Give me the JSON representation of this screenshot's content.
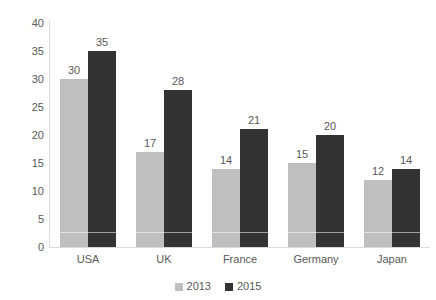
{
  "chart_data": {
    "type": "bar",
    "title": "",
    "subtitle": "",
    "xlabel": "",
    "ylabel": "",
    "categories": [
      "USA",
      "UK",
      "France",
      "Germany",
      "Japan"
    ],
    "series": [
      {
        "name": "2013",
        "color": "#bfbfbf",
        "values": [
          30,
          17,
          14,
          15,
          12
        ]
      },
      {
        "name": "2015",
        "color": "#333333",
        "values": [
          35,
          28,
          21,
          20,
          14
        ]
      }
    ],
    "ylim": [
      0,
      40
    ],
    "ytick_step": 5,
    "yticks": [
      0,
      5,
      10,
      15,
      20,
      25,
      30,
      35,
      40
    ],
    "ytick_labels": [
      "0",
      "5",
      "10",
      "15",
      "20",
      "25",
      "30",
      "35",
      "40"
    ],
    "grid": false,
    "data_labels": true,
    "legend_position": "bottom",
    "axis_color": "#d9d9d9",
    "text_color": "#595959",
    "background": "#ffffff"
  },
  "legend": {
    "items": [
      {
        "label": "2013",
        "color": "#bfbfbf"
      },
      {
        "label": "2015",
        "color": "#333333"
      }
    ]
  }
}
